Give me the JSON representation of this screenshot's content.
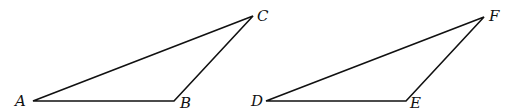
{
  "diagram": {
    "type": "geometry-triangles",
    "triangles": [
      {
        "name": "ABC",
        "vertices": [
          {
            "label": "A",
            "x": 33,
            "y": 101,
            "lx": 15,
            "ly": 106
          },
          {
            "label": "B",
            "x": 174,
            "y": 101,
            "lx": 180,
            "ly": 108
          },
          {
            "label": "C",
            "x": 253,
            "y": 16,
            "lx": 257,
            "ly": 21
          }
        ]
      },
      {
        "name": "DEF",
        "vertices": [
          {
            "label": "D",
            "x": 266,
            "y": 101,
            "lx": 251,
            "ly": 106
          },
          {
            "label": "E",
            "x": 406,
            "y": 101,
            "lx": 410,
            "ly": 108
          },
          {
            "label": "F",
            "x": 484,
            "y": 17,
            "lx": 489,
            "ly": 21
          }
        ]
      }
    ]
  }
}
